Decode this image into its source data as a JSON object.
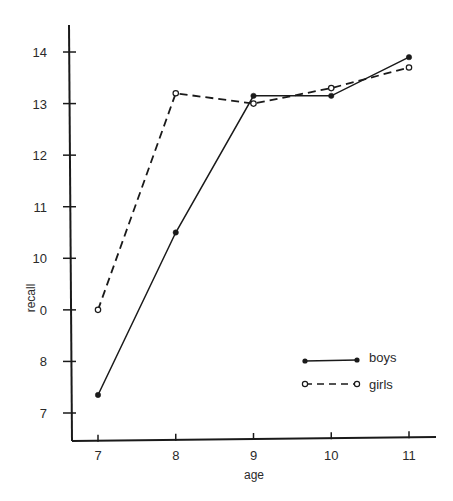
{
  "chart_data": {
    "type": "line",
    "title": "",
    "xlabel": "age",
    "ylabel": "recall",
    "x": [
      7,
      8,
      9,
      10,
      11
    ],
    "xlim": [
      6.67,
      11.35
    ],
    "ylim": [
      6.45,
      14.5
    ],
    "x_ticks": [
      "7",
      "8",
      "9",
      "10",
      "11"
    ],
    "y_ticks": [
      "7",
      "8",
      "9",
      "10",
      "11",
      "12",
      "13",
      "14"
    ],
    "y_tick_labels_as_printed": [
      "7",
      "8",
      "0",
      "10",
      "11",
      "12",
      "13",
      "14"
    ],
    "grid": false,
    "legend_position": "lower right",
    "series": [
      {
        "name": "boys",
        "style": "solid",
        "marker": "filled-circle",
        "color": "#1a1a1a",
        "values": [
          7.35,
          10.5,
          13.15,
          13.15,
          13.9
        ]
      },
      {
        "name": "girls",
        "style": "dashed",
        "marker": "open-circle",
        "color": "#1a1a1a",
        "values": [
          9.0,
          13.2,
          13.0,
          13.3,
          13.7
        ]
      }
    ]
  },
  "legend": {
    "boys_label": "boys",
    "girls_label": "girls"
  },
  "axes": {
    "x_title": "age",
    "y_title": "recall"
  }
}
